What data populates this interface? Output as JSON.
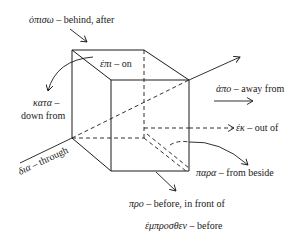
{
  "diagram": {
    "labels": {
      "opiso": {
        "greek": "ὀπισω",
        "sep": " – ",
        "gloss": "behind, after"
      },
      "epi": {
        "greek": "ἐπι",
        "sep": " – ",
        "gloss": "on"
      },
      "kata_greek": {
        "greek": "κατα",
        "sep": " –"
      },
      "kata_gloss": {
        "gloss": "down from"
      },
      "apo": {
        "greek": "ἀπο",
        "sep": " – ",
        "gloss": "away from"
      },
      "ek": {
        "greek": "ἐκ",
        "sep": " – ",
        "gloss": "out of"
      },
      "dia": {
        "greek": "δια",
        "sep": " – ",
        "gloss": "through"
      },
      "para": {
        "greek": "παρα",
        "sep": " – ",
        "gloss": "from beside"
      },
      "pro": {
        "greek": "προ",
        "sep": " – ",
        "gloss": "before, in front of"
      },
      "emprosthen": {
        "greek": "ἐμπροσθεν",
        "sep": " – ",
        "gloss": "before"
      }
    },
    "colors": {
      "ink": "#1a1a1a",
      "background": "#ffffff"
    }
  }
}
